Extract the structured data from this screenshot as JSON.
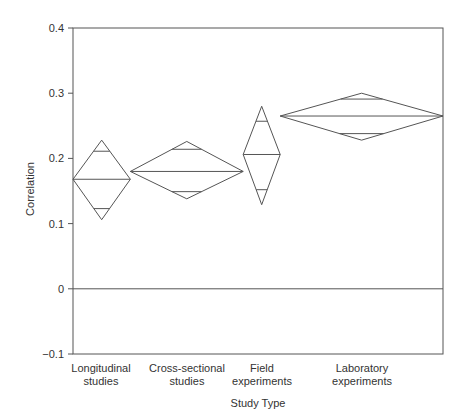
{
  "chart_data": {
    "type": "diamond-interval",
    "title": "",
    "xlabel": "Study Type",
    "ylabel": "Correlation",
    "ylim": [
      -0.1,
      0.4
    ],
    "yticks": [
      "0.4",
      "0.3",
      "0.2",
      "0.1",
      "0",
      "−0.1"
    ],
    "grid": false,
    "categories": [
      "Longitudinal studies",
      "Cross-sectional studies",
      "Field experiments",
      "Laboratory experiments"
    ],
    "category_lines": [
      [
        "Longitudinal",
        "studies"
      ],
      [
        "Cross-sectional",
        "studies"
      ],
      [
        "Field",
        "experiments"
      ],
      [
        "Laboratory",
        "experiments"
      ]
    ],
    "series": [
      {
        "name": "Longitudinal studies",
        "mean": 0.168,
        "ci_upper": 0.228,
        "ci_lower": 0.106,
        "inner_upper": 0.211,
        "inner_lower": 0.123,
        "x_start": 0,
        "x_end": 0.155
      },
      {
        "name": "Cross-sectional studies",
        "mean": 0.18,
        "ci_upper": 0.226,
        "ci_lower": 0.138,
        "inner_upper": 0.214,
        "inner_lower": 0.149,
        "x_start": 0.155,
        "x_end": 0.46
      },
      {
        "name": "Field experiments",
        "mean": 0.206,
        "ci_upper": 0.28,
        "ci_lower": 0.129,
        "inner_upper": 0.257,
        "inner_lower": 0.152,
        "x_start": 0.46,
        "x_end": 0.56
      },
      {
        "name": "Laboratory experiments",
        "mean": 0.265,
        "ci_upper": 0.3,
        "ci_lower": 0.228,
        "inner_upper": 0.291,
        "inner_lower": 0.238,
        "x_start": 0.56,
        "x_end": 1.0
      }
    ],
    "reference_line": 0
  }
}
